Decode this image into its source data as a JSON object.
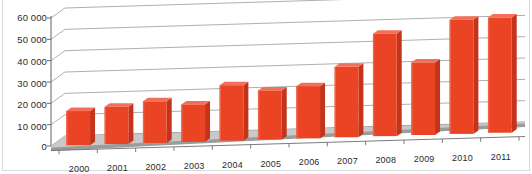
{
  "chart_data": {
    "type": "bar",
    "title": "",
    "subtitle": "",
    "xlabel": "",
    "ylabel": "",
    "categories": [
      "2000",
      "2001",
      "2002",
      "2003",
      "2004",
      "2005",
      "2006",
      "2007",
      "2008",
      "2009",
      "2010",
      "2011"
    ],
    "values": [
      16000,
      17500,
      19500,
      17500,
      26000,
      23000,
      24500,
      33000,
      48000,
      34000,
      53500,
      54000
    ],
    "series": [
      {
        "name": "",
        "color": "#ea4424",
        "values": [
          16000,
          17500,
          19500,
          17500,
          26000,
          23000,
          24500,
          33000,
          48000,
          34000,
          53500,
          54000
        ]
      }
    ],
    "ylim": [
      0,
      60000
    ],
    "yticks": [
      0,
      10000,
      20000,
      30000,
      40000,
      50000,
      60000
    ],
    "ytick_labels": [
      "0",
      "10 000",
      "20 000",
      "30 000",
      "40 000",
      "50 000",
      "60 000"
    ],
    "grid": true,
    "grid_axis": "y",
    "legend": false,
    "legend_position": "none",
    "style": "3d-column",
    "annotations": []
  },
  "colors": {
    "bar_front": "#ea4424",
    "bar_side": "#c4331a",
    "bar_top": "#f2705a",
    "floor": "#9b9b9b",
    "floor_top": "#c9c9c9",
    "grid_line": "#9a9a9a",
    "axis_line": "#6d6d6d",
    "text": "#2b2b2b",
    "background": "#ffffff"
  }
}
